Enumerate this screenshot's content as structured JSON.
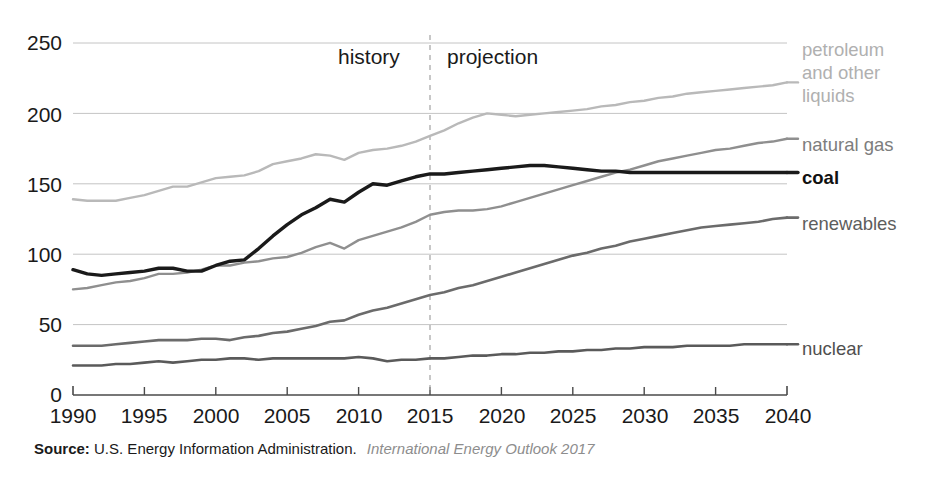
{
  "chart_data": {
    "type": "line",
    "title": "",
    "xlabel": "",
    "ylabel": "",
    "xlim": [
      1990,
      2040
    ],
    "ylim": [
      0,
      250
    ],
    "yticks": [
      0,
      50,
      100,
      150,
      200,
      250
    ],
    "xticks": [
      1990,
      1995,
      2000,
      2005,
      2010,
      2015,
      2020,
      2025,
      2030,
      2035,
      2040
    ],
    "grid": "horizontal",
    "legend_position": "right-inline",
    "annotations": [
      {
        "text": "history",
        "x": 2007.5,
        "y": 240
      },
      {
        "text": "projection",
        "x": 2022.5,
        "y": 240
      },
      {
        "text": "divider",
        "x": 2015,
        "style": "dashed-vertical"
      }
    ],
    "x": [
      1990,
      1991,
      1992,
      1993,
      1994,
      1995,
      1996,
      1997,
      1998,
      1999,
      2000,
      2001,
      2002,
      2003,
      2004,
      2005,
      2006,
      2007,
      2008,
      2009,
      2010,
      2011,
      2012,
      2013,
      2014,
      2015,
      2016,
      2017,
      2018,
      2019,
      2020,
      2021,
      2022,
      2023,
      2024,
      2025,
      2026,
      2027,
      2028,
      2029,
      2030,
      2031,
      2032,
      2033,
      2034,
      2035,
      2036,
      2037,
      2038,
      2039,
      2040
    ],
    "series": [
      {
        "name": "petroleum and other liquids",
        "color": "#b9b9b9",
        "label_color": "#b0b0b0",
        "width": 2.4,
        "label": "petroleum and other liquids",
        "values": [
          139,
          138,
          138,
          138,
          140,
          142,
          145,
          148,
          148,
          151,
          154,
          155,
          156,
          159,
          164,
          166,
          168,
          171,
          170,
          167,
          172,
          174,
          175,
          177,
          180,
          184,
          188,
          193,
          197,
          200,
          199,
          198,
          199,
          200,
          201,
          202,
          203,
          205,
          206,
          208,
          209,
          211,
          212,
          214,
          215,
          216,
          217,
          218,
          219,
          220,
          222
        ]
      },
      {
        "name": "natural gas",
        "color": "#8f8f8f",
        "label_color": "#7d7d7d",
        "width": 2.4,
        "label": "natural gas",
        "values": [
          75,
          76,
          78,
          80,
          81,
          83,
          86,
          86,
          87,
          89,
          92,
          92,
          94,
          95,
          97,
          98,
          101,
          105,
          108,
          104,
          110,
          113,
          116,
          119,
          123,
          128,
          130,
          131,
          131,
          132,
          134,
          137,
          140,
          143,
          146,
          149,
          152,
          155,
          158,
          160,
          163,
          166,
          168,
          170,
          172,
          174,
          175,
          177,
          179,
          180,
          182
        ]
      },
      {
        "name": "coal",
        "color": "#1a1a1a",
        "label_color": "#111111",
        "width": 3.4,
        "label": "coal",
        "values": [
          89,
          86,
          85,
          86,
          87,
          88,
          90,
          90,
          88,
          88,
          92,
          95,
          96,
          104,
          113,
          121,
          128,
          133,
          139,
          137,
          144,
          150,
          149,
          152,
          155,
          157,
          157,
          158,
          159,
          160,
          161,
          162,
          163,
          163,
          162,
          161,
          160,
          159,
          159,
          158,
          158,
          158,
          158,
          158,
          158,
          158,
          158,
          158,
          158,
          158,
          158
        ]
      },
      {
        "name": "renewables",
        "color": "#6b6b6b",
        "label_color": "#5d5d5d",
        "width": 2.6,
        "label": "renewables",
        "values": [
          35,
          35,
          35,
          36,
          37,
          38,
          39,
          39,
          39,
          40,
          40,
          39,
          41,
          42,
          44,
          45,
          47,
          49,
          52,
          53,
          57,
          60,
          62,
          65,
          68,
          71,
          73,
          76,
          78,
          81,
          84,
          87,
          90,
          93,
          96,
          99,
          101,
          104,
          106,
          109,
          111,
          113,
          115,
          117,
          119,
          120,
          121,
          122,
          123,
          125,
          126
        ]
      },
      {
        "name": "nuclear",
        "color": "#5a5a5a",
        "label_color": "#4f4f4f",
        "width": 2.6,
        "label": "nuclear",
        "values": [
          21,
          21,
          21,
          22,
          22,
          23,
          24,
          23,
          24,
          25,
          25,
          26,
          26,
          25,
          26,
          26,
          26,
          26,
          26,
          26,
          27,
          26,
          24,
          25,
          25,
          26,
          26,
          27,
          28,
          28,
          29,
          29,
          30,
          30,
          31,
          31,
          32,
          32,
          33,
          33,
          34,
          34,
          34,
          35,
          35,
          35,
          35,
          36,
          36,
          36,
          36
        ]
      }
    ]
  },
  "axis": {
    "ytick_labels": [
      "250",
      "200",
      "150",
      "100",
      "50",
      "0"
    ],
    "xtick_labels": [
      "1990",
      "1995",
      "2000",
      "2005",
      "2010",
      "2015",
      "2020",
      "2025",
      "2030",
      "2035",
      "2040"
    ]
  },
  "annotations": {
    "history": "history",
    "projection": "projection"
  },
  "legend": {
    "petroleum_line1": "petroleum",
    "petroleum_line2": "and other",
    "petroleum_line3": "liquids",
    "natural_gas": "natural gas",
    "coal": "coal",
    "renewables": "renewables",
    "nuclear": "nuclear"
  },
  "source": {
    "label": "Source:",
    "organization": "U.S. Energy Information Administration.",
    "publication": "International Energy Outlook 2017"
  },
  "colors": {
    "petroleum": "#b9b9b9",
    "natural_gas": "#8f8f8f",
    "coal": "#1a1a1a",
    "renewables": "#6b6b6b",
    "nuclear": "#5a5a5a",
    "gridline": "#c4c4c4",
    "axis": "#4a4a4a"
  }
}
